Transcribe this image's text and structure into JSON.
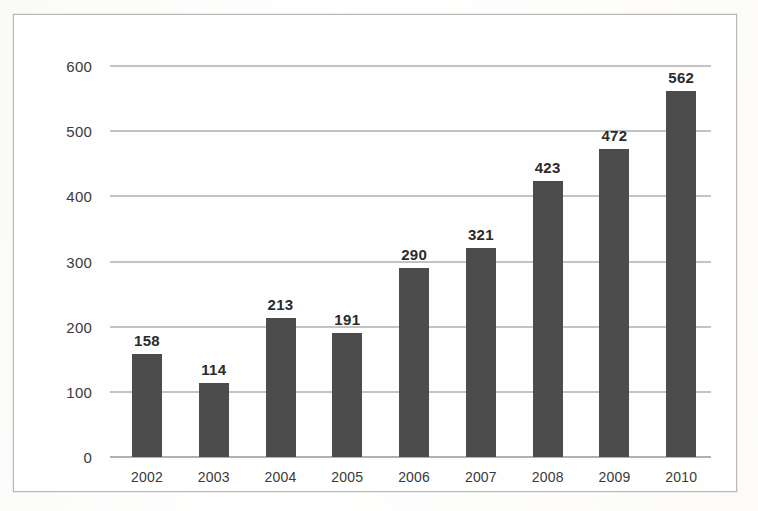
{
  "chart_data": {
    "type": "bar",
    "title": "",
    "subtitle": "",
    "xlabel": "",
    "ylabel": "",
    "categories": [
      "2002",
      "2003",
      "2004",
      "2005",
      "2006",
      "2007",
      "2008",
      "2009",
      "2010"
    ],
    "values": [
      158,
      114,
      213,
      191,
      290,
      321,
      423,
      472,
      562
    ],
    "data_labels": [
      "158",
      "114",
      "213",
      "191",
      "290",
      "321",
      "423",
      "472",
      "562"
    ],
    "ylim": [
      0,
      600
    ],
    "ytick_values": [
      0,
      100,
      200,
      300,
      400,
      500,
      600
    ],
    "ytick_labels": [
      "0",
      "100",
      "200",
      "300",
      "400",
      "500",
      "600"
    ],
    "grid": "horizontal",
    "legend": "none",
    "series": [
      {
        "name": "",
        "values": [
          158,
          114,
          213,
          191,
          290,
          321,
          423,
          472,
          562
        ],
        "color": "#4c4c4c"
      }
    ],
    "colors": {
      "bar": "#4c4c4c",
      "gridline": "#c3c3c3",
      "axis": "#b0b0b0",
      "label_text": "#2b2b2b",
      "tick_text": "#3a3a3a",
      "frame": "#b9b9b9",
      "background": "#fefefe"
    }
  }
}
